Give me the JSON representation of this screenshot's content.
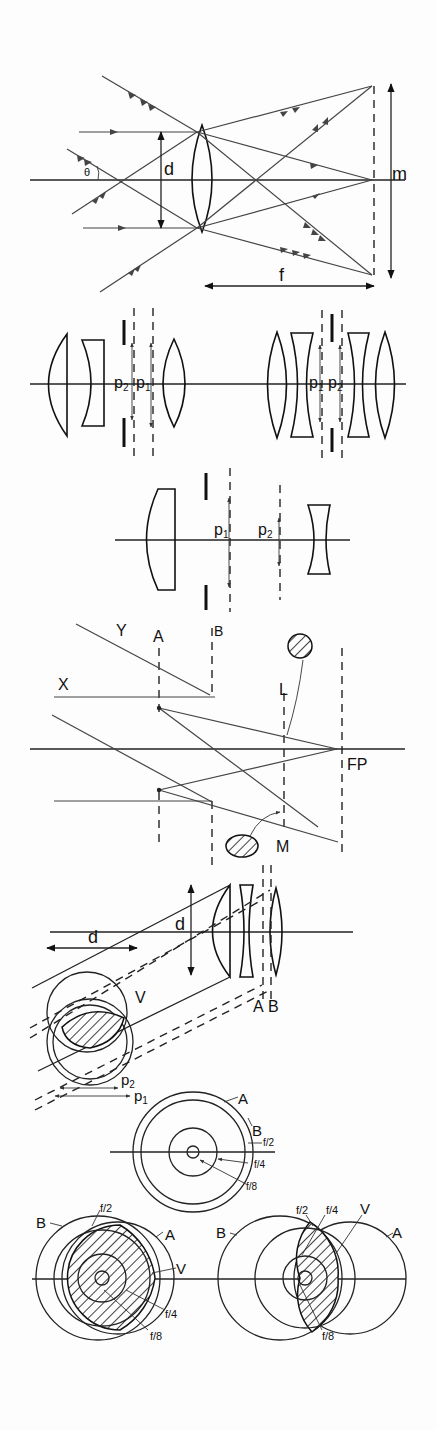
{
  "figure": {
    "width": 437,
    "height": 1430,
    "background": "#fdfdfd",
    "ink": "#222222",
    "panels": [
      {
        "id": "panel-1-lens-ray-geometry",
        "labels": {
          "theta": "θ",
          "diameter": "d",
          "image_size": "m",
          "focal_length": "f"
        }
      },
      {
        "id": "panel-2-two-lens-systems",
        "labels": {
          "left_p2": "p",
          "left_p2_sub": "2",
          "left_p1": "p",
          "left_p1_sub": "1",
          "right_p1": "p",
          "right_p1_sub": "1",
          "right_p2": "p",
          "right_p2_sub": "2"
        }
      },
      {
        "id": "panel-3-pupil-positions",
        "labels": {
          "p1": "p",
          "p1_sub": "1",
          "p2": "p",
          "p2_sub": "2"
        }
      },
      {
        "id": "panel-4-vignetting-rays",
        "labels": {
          "ray_y": "Y",
          "stop_a": "A",
          "stop_b": "B",
          "ray_x": "X",
          "lens_l": "L",
          "focal_plane": "FP",
          "lens_m": "M"
        }
      },
      {
        "id": "panel-5-oblique-beam",
        "labels": {
          "d_left": "d",
          "d_lens": "d",
          "vignetted_area": "V",
          "stop_a": "A",
          "stop_b": "B",
          "p2": "p",
          "p2_sub": "2",
          "p1": "p",
          "p1_sub": "1"
        }
      },
      {
        "id": "panel-6-concentric-apertures",
        "labels": {
          "a": "A",
          "b": "B",
          "f2": "f/2",
          "f4": "f/4",
          "f8": "f/8"
        }
      },
      {
        "id": "panel-7-off-axis-apertures",
        "left": {
          "b": "B",
          "f2": "f/2",
          "a": "A",
          "v": "V",
          "f4": "f/4",
          "f8": "f/8"
        },
        "right": {
          "b": "B",
          "f2": "f/2",
          "f4": "f/4",
          "v": "V",
          "a": "A",
          "f8": "f/8"
        }
      }
    ]
  }
}
